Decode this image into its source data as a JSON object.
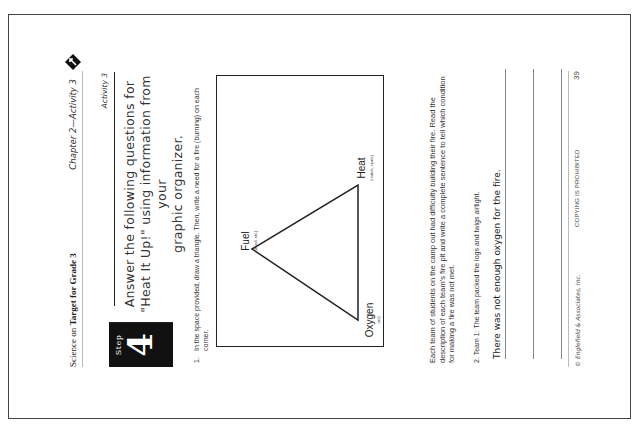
{
  "header": {
    "book_title_prefix": "Science on ",
    "book_title_bold": "Target for Grade 3",
    "chapter": "Chapter 2—Activity 3",
    "logo_icon": "target-arrow-icon"
  },
  "activity_label": "Activity 3",
  "step": {
    "word": "Step",
    "number": "4"
  },
  "title": {
    "line1": "Answer the following questions for",
    "line2": "\"Heat It Up!\" using information from your",
    "line3": "graphic organizer."
  },
  "question1": {
    "number": "1.",
    "text": "In the space provided, draw a triangle. Then, write a need for a fire (burning) on each corner."
  },
  "diagram": {
    "corners": [
      {
        "label": "Fuel",
        "sub": "(wood, etc.)"
      },
      {
        "label": "Heat",
        "sub": "(match, spark)"
      },
      {
        "label": "Oxygen",
        "sub": "(air)"
      }
    ]
  },
  "instructions": "Each team of students on the camp out had difficulty building their fire. Read the description of each team's fire pit and write a complete sentence to tell which condition for making a fire was not met.",
  "question2": {
    "number": "2.",
    "text": "Team 1: The team packed the logs and twigs airtight.",
    "answer": "There was not enough oxygen for the fire."
  },
  "footer": {
    "copyright": "© Englefield & Associates, Inc.",
    "notice": "COPYING IS PROHIBITED",
    "page_number": "39"
  }
}
